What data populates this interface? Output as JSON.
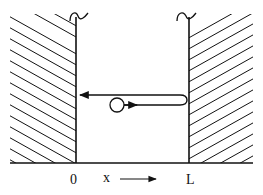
{
  "diagram": {
    "labels": {
      "origin": "0",
      "axis": "x",
      "right_wall": "L"
    },
    "elements": {
      "left_wall": "hatched wall at x = 0",
      "right_wall": "hatched wall at x = L",
      "particle": "circle moving right then reflecting left",
      "trajectory": "path to right wall, reflection, return leftward"
    },
    "colors": {
      "stroke": "#111111",
      "background": "#ffffff"
    }
  }
}
